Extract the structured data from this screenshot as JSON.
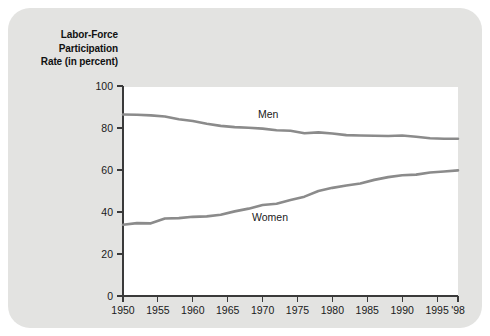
{
  "chart_data": {
    "type": "line",
    "title": "Labor-Force Participation Rate (in percent)",
    "title_lines": [
      "Labor-Force",
      "Participation",
      "Rate (in percent)"
    ],
    "xlabel": "",
    "ylabel": "Labor-Force Participation Rate (in percent)",
    "xlim": [
      1950,
      1998
    ],
    "ylim": [
      0,
      100
    ],
    "grid": false,
    "legend_position": "inline-annotation",
    "line_color": "#8b8b8b",
    "panel_color": "#ffffff",
    "background_color": "#e3e3e1",
    "y_ticks": [
      0,
      20,
      40,
      60,
      80,
      100
    ],
    "y_tick_labels": [
      "0",
      "20",
      "40",
      "60",
      "80",
      "100"
    ],
    "x_ticks": [
      1950,
      1955,
      1960,
      1965,
      1970,
      1975,
      1980,
      1985,
      1990,
      1995,
      1998
    ],
    "x_tick_labels": [
      "1950",
      "1955",
      "1960",
      "1965",
      "1970",
      "1975",
      "1980",
      "1985",
      "1990",
      "1995",
      "'98"
    ],
    "x": [
      1950,
      1952,
      1954,
      1956,
      1958,
      1960,
      1962,
      1964,
      1966,
      1968,
      1970,
      1972,
      1974,
      1976,
      1978,
      1980,
      1982,
      1984,
      1986,
      1988,
      1990,
      1992,
      1994,
      1996,
      1998
    ],
    "series": [
      {
        "name": "Men",
        "label": "Men",
        "color": "#8b8b8b",
        "values": [
          86.4,
          86.3,
          86.0,
          85.5,
          84.2,
          83.3,
          82.0,
          81.0,
          80.4,
          80.1,
          79.7,
          78.9,
          78.7,
          77.5,
          77.9,
          77.4,
          76.6,
          76.4,
          76.3,
          76.2,
          76.4,
          75.8,
          75.1,
          74.9,
          74.9
        ]
      },
      {
        "name": "Women",
        "label": "Women",
        "color": "#8b8b8b",
        "values": [
          33.9,
          34.7,
          34.6,
          36.9,
          37.1,
          37.7,
          37.9,
          38.7,
          40.3,
          41.6,
          43.3,
          43.9,
          45.7,
          47.3,
          50.0,
          51.5,
          52.6,
          53.6,
          55.3,
          56.6,
          57.5,
          57.8,
          58.8,
          59.3,
          59.8
        ]
      }
    ],
    "annotations": [
      {
        "text": "Men",
        "x_px": 258,
        "y_px": 118
      },
      {
        "text": "Women",
        "x_px": 252,
        "y_px": 221
      }
    ]
  }
}
